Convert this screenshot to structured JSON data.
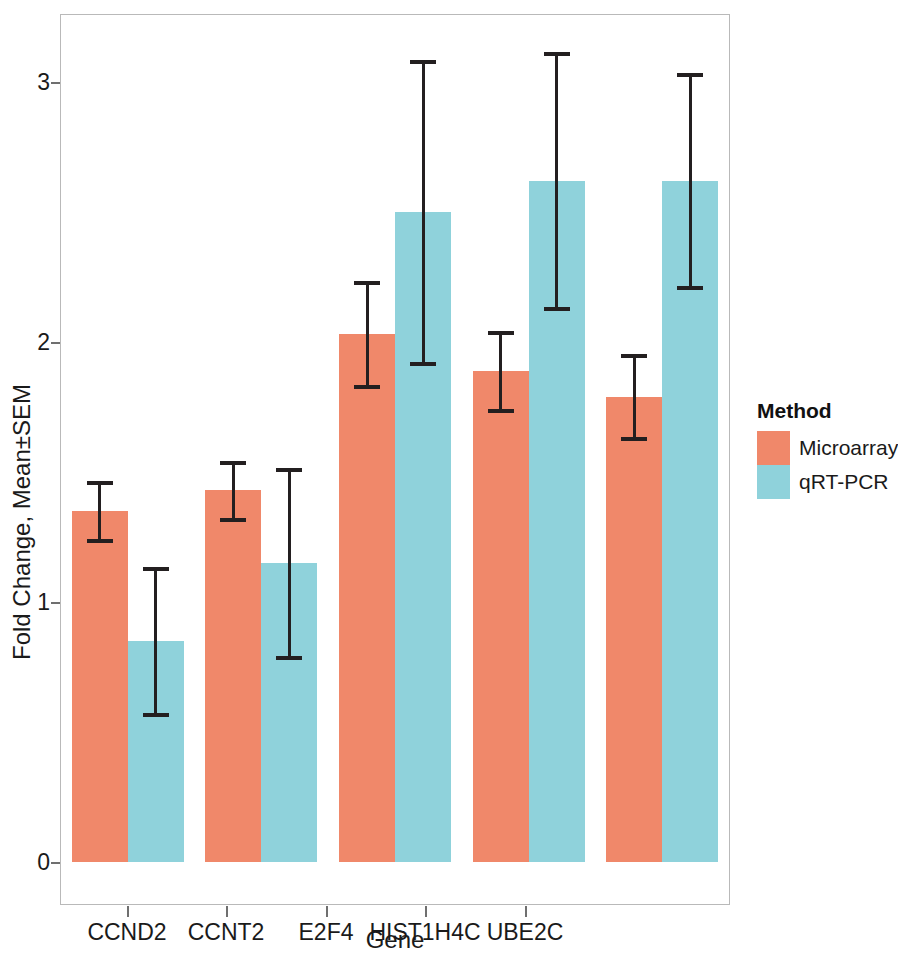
{
  "chart_data": {
    "type": "bar",
    "title": "",
    "xlabel": "Gene",
    "ylabel": "Fold Change, Mean±SEM",
    "categories": [
      "CCND2",
      "CCNT2",
      "E2F4",
      "HIST1H4C",
      "UBE2C"
    ],
    "series": [
      {
        "name": "Microarray",
        "color": "#F0886A",
        "values": [
          1.35,
          1.43,
          2.03,
          1.89,
          1.79
        ],
        "errors": [
          0.11,
          0.11,
          0.2,
          0.15,
          0.16
        ],
        "lower": [
          1.24,
          1.32,
          1.83,
          1.74,
          1.63
        ],
        "upper": [
          1.46,
          1.54,
          2.23,
          2.04,
          1.95
        ]
      },
      {
        "name": "qRT-PCR",
        "color": "#8FD2DB",
        "values": [
          0.85,
          1.15,
          2.5,
          2.62,
          2.62
        ],
        "errors": [
          0.28,
          0.36,
          0.58,
          0.49,
          0.41
        ],
        "lower": [
          0.57,
          0.79,
          1.92,
          2.13,
          2.21
        ],
        "upper": [
          1.13,
          1.51,
          3.08,
          3.11,
          3.03
        ]
      }
    ],
    "ylim": [
      0,
      3.29
    ],
    "yticks": [
      0,
      1,
      2,
      3
    ],
    "ytick_labels": [
      "0",
      "1",
      "2",
      "3"
    ],
    "grid": false,
    "legend": {
      "title": "Method",
      "position": "right",
      "entries": [
        "Microarray",
        "qRT-PCR"
      ]
    }
  },
  "legend": {
    "title": "Method",
    "items": [
      {
        "label": "Microarray",
        "color": "#F0886A"
      },
      {
        "label": "qRT-PCR",
        "color": "#8FD2DB"
      }
    ]
  },
  "axes": {
    "x_title": "Gene",
    "y_title": "Fold Change, Mean±SEM",
    "y_tick_labels": [
      "3",
      "2",
      "1",
      "0"
    ],
    "x_tick_labels": [
      "CCND2",
      "CCNT2",
      "E2F4",
      "HIST1H4C",
      "UBE2C"
    ]
  },
  "colors": {
    "microarray": "#F0886A",
    "qrt_pcr": "#8FD2DB",
    "error_bar": "#231f20",
    "panel_border": "#b9b9b9",
    "axis": "#6f6f6f",
    "background": "#ffffff"
  }
}
